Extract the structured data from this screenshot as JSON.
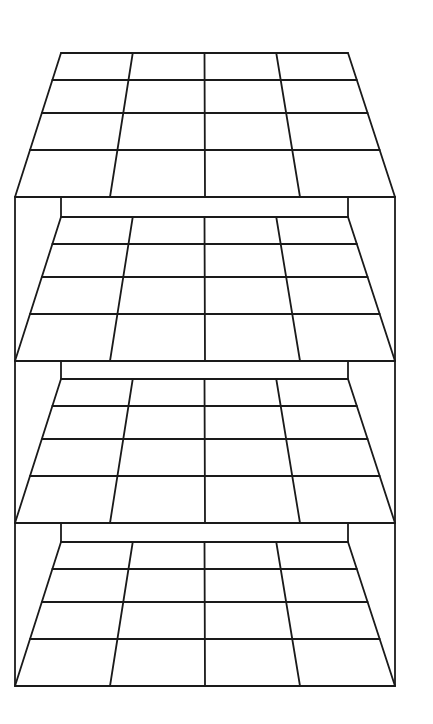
{
  "diagram": {
    "title": "",
    "type": "stacked-perspective-shelves",
    "stroke_color": "#1a1a1a",
    "background_color": "#ffffff",
    "stroke_width": 1.8,
    "frame": {
      "left_x": 15,
      "right_x": 395,
      "top_y": 197,
      "bottom_y": 686
    },
    "grid_columns": 4,
    "grid_rows": 4,
    "layers": [
      {
        "name": "top-layer",
        "back_wall": null,
        "floor": {
          "back_y": 53,
          "back_left_x": 61,
          "back_right_x": 348,
          "front_y": 197,
          "front_left_x": 15,
          "front_right_x": 395,
          "row_lines_y": [
            80,
            113,
            150
          ]
        }
      },
      {
        "name": "shelf-2",
        "back_wall": {
          "top_y": 197,
          "bottom_y": 217,
          "left_x": 61,
          "right_x": 348
        },
        "floor": {
          "back_y": 217,
          "back_left_x": 61,
          "back_right_x": 348,
          "front_y": 361,
          "front_left_x": 15,
          "front_right_x": 395,
          "row_lines_y": [
            244,
            277,
            314
          ]
        }
      },
      {
        "name": "shelf-3",
        "back_wall": {
          "top_y": 361,
          "bottom_y": 379,
          "left_x": 61,
          "right_x": 348
        },
        "floor": {
          "back_y": 379,
          "back_left_x": 61,
          "back_right_x": 348,
          "front_y": 523,
          "front_left_x": 15,
          "front_right_x": 395,
          "row_lines_y": [
            406,
            439,
            476
          ]
        }
      },
      {
        "name": "shelf-4",
        "back_wall": {
          "top_y": 523,
          "bottom_y": 542,
          "left_x": 61,
          "right_x": 348
        },
        "floor": {
          "back_y": 542,
          "back_left_x": 61,
          "back_right_x": 348,
          "front_y": 686,
          "front_left_x": 15,
          "front_right_x": 395,
          "row_lines_y": [
            569,
            602,
            639
          ]
        }
      }
    ]
  }
}
